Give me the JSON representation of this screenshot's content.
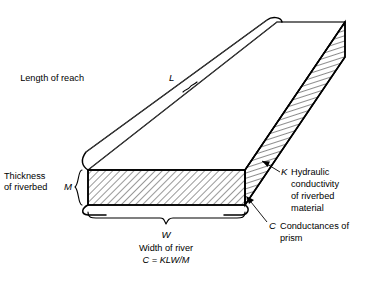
{
  "figure": {
    "background_color": "#ffffff",
    "line_color": "#000000",
    "labels": {
      "length_of_reach": "Length of reach",
      "length_symbol": "L",
      "thickness_line1": "Thickness",
      "thickness_line2": "of riverbed",
      "thickness_symbol": "M",
      "width_symbol": "W",
      "width_of_river": "Width of river",
      "formula": "C = KLW/M",
      "k_symbol": "K",
      "k_line1": "Hydraulic",
      "k_line2": "conductivity",
      "k_line3": "of riverbed",
      "k_line4": "material",
      "c_symbol": "C",
      "c_line1": "Conductances of",
      "c_line2": "prism"
    }
  }
}
